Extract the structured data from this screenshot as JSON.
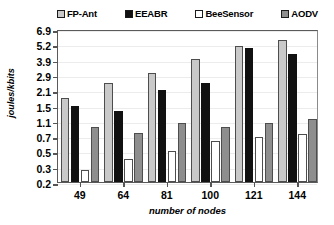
{
  "chart_data": {
    "type": "bar",
    "title": "",
    "xlabel": "number of nodes",
    "ylabel": "joules/kbits",
    "categories": [
      "49",
      "64",
      "81",
      "100",
      "121",
      "144"
    ],
    "ytick_labels": [
      "6.9",
      "5.2",
      "3.9",
      "2.9",
      "2.1",
      "1.5",
      "1.1",
      "0.7",
      "0.5",
      "0.3",
      "0.2"
    ],
    "ylim": [
      0.2,
      6.9
    ],
    "yscale": "log",
    "grid": true,
    "legend_position": "top",
    "series": [
      {
        "name": "FP-Ant",
        "color": "#c9c9c9",
        "values": [
          1.8,
          2.5,
          3.05,
          3.95,
          5.05,
          5.7
        ]
      },
      {
        "name": "EEABR",
        "color": "#111111",
        "values": [
          1.5,
          1.35,
          2.1,
          2.5,
          4.9,
          4.4
        ]
      },
      {
        "name": "BeeSensor",
        "color": "#ffffff",
        "values": [
          0.28,
          0.4,
          0.51,
          0.63,
          0.69,
          0.75
        ]
      },
      {
        "name": "AODV",
        "color": "#8e8e8e",
        "values": [
          0.95,
          0.78,
          1.05,
          0.95,
          1.03,
          1.15
        ]
      }
    ]
  }
}
